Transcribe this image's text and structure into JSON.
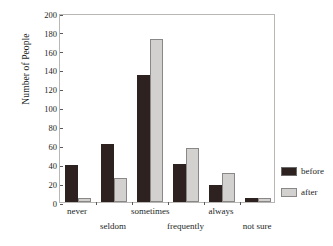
{
  "chart_data": {
    "type": "bar",
    "title": "",
    "xlabel": "",
    "ylabel": "Number of People",
    "ylim": [
      0,
      200
    ],
    "ytick_step": 20,
    "yticks": [
      200,
      180,
      160,
      140,
      120,
      100,
      80,
      60,
      40,
      20,
      0
    ],
    "grid": false,
    "legend_position": "right",
    "categories": [
      "never",
      "seldom",
      "sometimes",
      "frequently",
      "always",
      "not sure"
    ],
    "series": [
      {
        "name": "before",
        "color": "#2e2220",
        "values": [
          39,
          61,
          134,
          40,
          18,
          4
        ]
      },
      {
        "name": "after",
        "color": "#d2d1cf",
        "values": [
          4,
          25,
          172,
          57,
          31,
          4
        ]
      }
    ]
  },
  "legend": {
    "items": [
      {
        "label": "before"
      },
      {
        "label": "after"
      }
    ]
  }
}
